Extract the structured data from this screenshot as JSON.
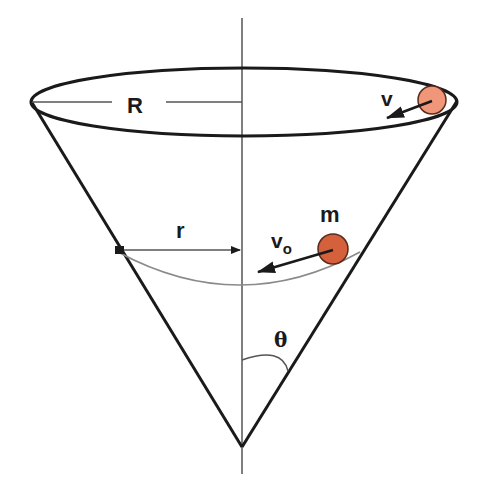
{
  "diagram": {
    "labels": {
      "R": "R",
      "r": "r",
      "v": "v",
      "v0_main": "v",
      "v0_sub": "o",
      "m": "m",
      "theta": "θ"
    },
    "colors": {
      "line": "#1a1a1a",
      "axis": "#555555",
      "path": "#8a8a8a",
      "ball_top": "#f0977a",
      "ball_mid": "#d4603c",
      "ball_stroke": "#5a2a1a"
    },
    "elements": [
      "cone-rim-ellipse",
      "cone-sides",
      "vertical-axis",
      "radius-R-dashline",
      "radius-r-arrow",
      "circular-path",
      "ball-top-with-velocity-v",
      "ball-mass-m-with-velocity-v0",
      "angle-theta-arc"
    ]
  }
}
